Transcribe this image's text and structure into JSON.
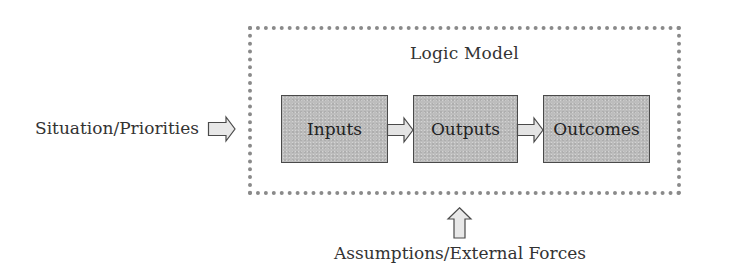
{
  "diagram": {
    "title": "Logic Model",
    "stages": [
      {
        "label": "Inputs"
      },
      {
        "label": "Outputs"
      },
      {
        "label": "Outcomes"
      }
    ],
    "left_input": {
      "label": "Situation/Priorities",
      "arrow": "right-block-arrow-icon"
    },
    "bottom_input": {
      "label": "Assumptions/External Forces",
      "arrow": "up-block-arrow-icon"
    },
    "connectors": [
      {
        "from": "Inputs",
        "to": "Outputs",
        "arrow": "right-block-arrow-icon"
      },
      {
        "from": "Outputs",
        "to": "Outcomes",
        "arrow": "right-block-arrow-icon"
      }
    ],
    "colors": {
      "box_fill": "#bdbdbd",
      "box_border": "#4a4a4a",
      "frame_dots": "#8a8a8a",
      "arrow_fill": "#e6e6e6",
      "text": "#2a2a2a"
    }
  }
}
